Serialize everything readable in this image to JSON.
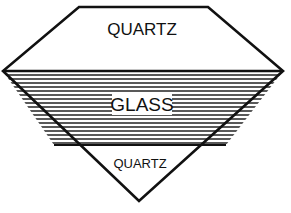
{
  "diagram": {
    "type": "layered-gem-cross-section",
    "layers": [
      {
        "name": "top",
        "label": "QUARTZ",
        "fill": "white"
      },
      {
        "name": "middle",
        "label": "GLASS",
        "fill": "horizontal-stripes"
      },
      {
        "name": "bottom",
        "label": "QUARTZ",
        "fill": "white"
      }
    ]
  },
  "colors": {
    "stroke": "#111111",
    "background": "#ffffff"
  }
}
